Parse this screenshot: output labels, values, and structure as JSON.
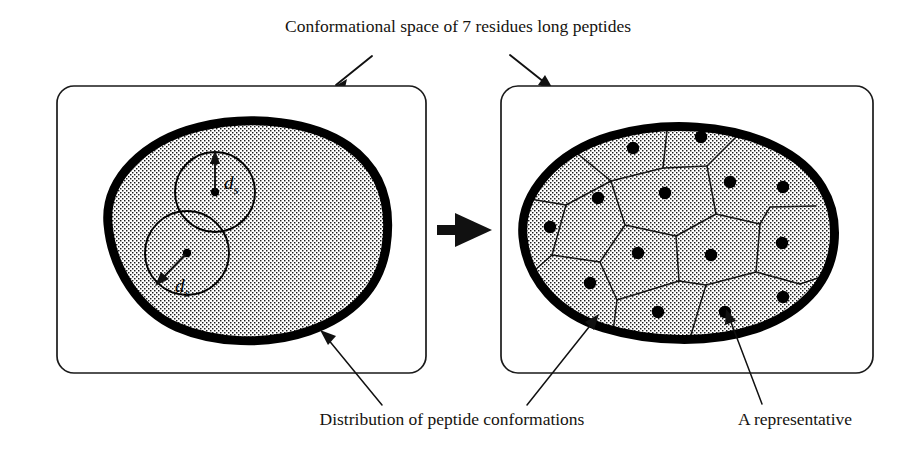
{
  "figure": {
    "title": "Conformational space of 7 residues long peptides",
    "bottom_left_caption": "Distribution of peptide conformations",
    "bottom_right_caption": "A representative",
    "transform_arrow": "thick-right-arrow",
    "colors": {
      "ink": "#111111",
      "blob_outline": "#000000",
      "stipple": "#1a1a1a",
      "background": "#ffffff",
      "panel_border": "#1a1a1a"
    }
  },
  "left_panel": {
    "name": "conformational-space-before-clustering",
    "radius_label_upper": "d",
    "radius_label_upper_sub": "s",
    "radius_label_lower": "d",
    "radius_label_lower_sub": "s",
    "circles": [
      {
        "cx": 215,
        "cy": 192,
        "r": 40,
        "arrow_dir": "up"
      },
      {
        "cx": 187,
        "cy": 253,
        "r": 42,
        "arrow_dir": "down-left"
      }
    ]
  },
  "right_panel": {
    "name": "conformational-space-after-clustering",
    "representative_count": 14,
    "representatives": [
      {
        "cx": 633,
        "cy": 148
      },
      {
        "cx": 701,
        "cy": 137
      },
      {
        "cx": 598,
        "cy": 198
      },
      {
        "cx": 665,
        "cy": 193
      },
      {
        "cx": 730,
        "cy": 182
      },
      {
        "cx": 783,
        "cy": 187
      },
      {
        "cx": 550,
        "cy": 227
      },
      {
        "cx": 638,
        "cy": 253
      },
      {
        "cx": 711,
        "cy": 255
      },
      {
        "cx": 782,
        "cy": 243
      },
      {
        "cx": 590,
        "cy": 283
      },
      {
        "cx": 658,
        "cy": 312
      },
      {
        "cx": 725,
        "cy": 312
      },
      {
        "cx": 783,
        "cy": 297
      }
    ]
  }
}
